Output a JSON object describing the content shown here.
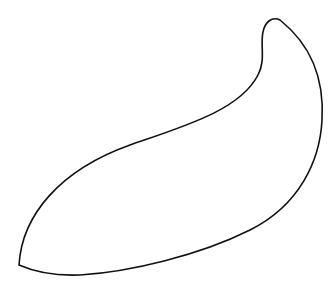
{
  "canvas": {
    "width": 334,
    "height": 291,
    "background": "#ffffff"
  },
  "drawing": {
    "subject": "curved-leaf-outline",
    "stroke_color": "#111111",
    "path": "M 19 265 C 22 215 60 170 130 145 C 185 126 240 110 258 75 C 266 60 260 45 263 32 C 265 22 272 16 280 20 C 305 40 325 70 322 120 C 320 160 300 205 250 230 C 200 255 130 272 80 275 C 55 276 35 272 19 265 Z"
  }
}
